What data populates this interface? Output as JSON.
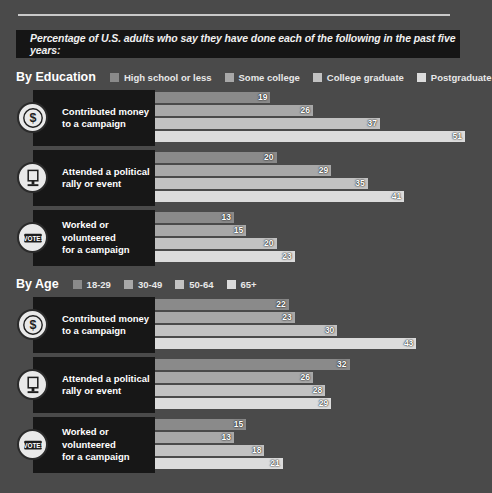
{
  "banner": {
    "text": "Percentage of U.S. adults who say they have done each of the following in the past five years:"
  },
  "colors": {
    "background": "#4a4a4a",
    "panel": "#171717",
    "banner": "#151515",
    "rule": "#c9c9c9",
    "series": [
      "#8a8a8a",
      "#a8a8a8",
      "#c2c2c2",
      "#dcdcdc"
    ]
  },
  "sections": [
    {
      "title": "By Education",
      "legend": [
        "High school or less",
        "Some college",
        "College graduate",
        "Postgraduate"
      ]
    },
    {
      "title": "By Age",
      "legend": [
        "18-29",
        "30-49",
        "50-64",
        "65+"
      ]
    }
  ],
  "activities": [
    {
      "label": "Contributed money\nto a campaign",
      "icon": "dollar-coin-icon"
    },
    {
      "label": "Attended a political\nrally or event",
      "icon": "podium-icon"
    },
    {
      "label": "Worked or volunteered\nfor a campaign",
      "icon": "vote-badge-icon"
    }
  ],
  "chart_data": {
    "type": "bar",
    "subtitle": "Percentage of U.S. adults who say they have done each of the following in the past five years:",
    "xlabel": "",
    "ylabel": "",
    "xlim": [
      0,
      51
    ],
    "grid": false,
    "orientation": "horizontal",
    "legend_position": "top",
    "panels": [
      {
        "panel": "By Education",
        "series_names": [
          "High school or less",
          "Some college",
          "College graduate",
          "Postgraduate"
        ],
        "categories": [
          "Contributed money to a campaign",
          "Attended a political rally or event",
          "Worked or volunteered for a campaign"
        ],
        "series": [
          {
            "name": "High school or less",
            "values": [
              19,
              20,
              13
            ]
          },
          {
            "name": "Some college",
            "values": [
              26,
              29,
              15
            ]
          },
          {
            "name": "College graduate",
            "values": [
              37,
              35,
              20
            ]
          },
          {
            "name": "Postgraduate",
            "values": [
              51,
              41,
              23
            ]
          }
        ]
      },
      {
        "panel": "By Age",
        "series_names": [
          "18-29",
          "30-49",
          "50-64",
          "65+"
        ],
        "categories": [
          "Contributed money to a campaign",
          "Attended a political rally or event",
          "Worked or volunteered for a campaign"
        ],
        "series": [
          {
            "name": "18-29",
            "values": [
              22,
              32,
              15
            ]
          },
          {
            "name": "30-49",
            "values": [
              23,
              26,
              13
            ]
          },
          {
            "name": "50-64",
            "values": [
              30,
              28,
              18
            ]
          },
          {
            "name": "65+",
            "values": [
              43,
              29,
              21
            ]
          }
        ]
      }
    ]
  }
}
